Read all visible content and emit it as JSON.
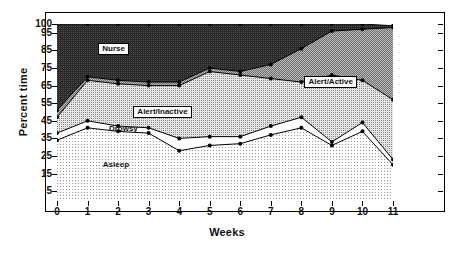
{
  "chart_data": {
    "type": "area",
    "title": "",
    "xlabel": "Weeks",
    "ylabel": "Percent time",
    "x": [
      0,
      1,
      2,
      3,
      4,
      5,
      6,
      7,
      8,
      9,
      10,
      11
    ],
    "xticklabels": [
      "0",
      "1",
      "2",
      "3",
      "4",
      "5",
      "6",
      "7",
      "8",
      "9",
      "10",
      "11"
    ],
    "yticklabels": [
      "5",
      "15",
      "25",
      "35",
      "45",
      "55",
      "65",
      "75",
      "85",
      "95",
      "100"
    ],
    "ytickvalues": [
      5,
      15,
      25,
      35,
      45,
      55,
      65,
      75,
      85,
      95,
      100
    ],
    "ylim": [
      0,
      100
    ],
    "xlim": [
      0,
      11
    ],
    "grid": false,
    "legend_position": "inline-annotations",
    "stacked": true,
    "series": [
      {
        "name": "Asleep",
        "color": "#e8e8e8",
        "cumulative": [
          34,
          41,
          39,
          38,
          28,
          31,
          32,
          37,
          41,
          31,
          39,
          20
        ],
        "values": [
          34,
          41,
          39,
          38,
          28,
          31,
          32,
          37,
          41,
          31,
          39,
          20
        ]
      },
      {
        "name": "Drowsy",
        "color": "#ffffff",
        "cumulative": [
          38,
          45,
          42,
          41,
          35,
          36,
          36,
          42,
          47,
          33,
          44,
          23
        ],
        "values": [
          4,
          4,
          3,
          3,
          7,
          5,
          4,
          5,
          6,
          2,
          5,
          3
        ]
      },
      {
        "name": "Alert/Inactive",
        "color": "#c4c4c4",
        "cumulative": [
          47,
          68,
          66,
          65,
          65,
          73,
          71,
          69,
          67,
          71,
          68,
          57
        ],
        "values": [
          9,
          23,
          24,
          24,
          30,
          37,
          35,
          27,
          20,
          38,
          24,
          34
        ]
      },
      {
        "name": "Alert/Active",
        "color": "#a0a0a0",
        "cumulative": [
          51,
          70,
          68,
          67,
          67,
          75,
          73,
          77,
          86,
          96,
          97,
          98
        ],
        "values": [
          4,
          2,
          2,
          2,
          2,
          2,
          2,
          8,
          19,
          25,
          29,
          41
        ]
      },
      {
        "name": "Nurse",
        "color": "#2b2b2b",
        "cumulative": [
          100,
          100,
          100,
          100,
          100,
          100,
          100,
          100,
          100,
          100,
          100,
          99
        ],
        "values": [
          49,
          30,
          32,
          33,
          33,
          25,
          27,
          23,
          14,
          4,
          3,
          1
        ]
      }
    ],
    "annotations": [
      {
        "text": "Nurse",
        "x": 1.35,
        "y": 86,
        "boxed": true
      },
      {
        "text": "Alert/Inactive",
        "x": 2.5,
        "y": 50,
        "boxed": true
      },
      {
        "text": "Alert/Active",
        "x": 8.1,
        "y": 67,
        "boxed": true
      },
      {
        "text": "Drowsy",
        "x": 1.7,
        "y": 39,
        "boxed": false
      },
      {
        "text": "Asleep",
        "x": 1.5,
        "y": 19,
        "boxed": false
      }
    ]
  }
}
